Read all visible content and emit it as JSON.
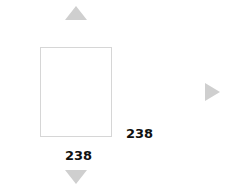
{
  "controls": {
    "up_icon": "triangle-up",
    "down_icon": "triangle-down",
    "right_icon": "triangle-right"
  },
  "box": {
    "width_label": "238",
    "height_label": "238"
  },
  "colors": {
    "arrow": "#cfcfcf",
    "box_border": "#d6d6d6",
    "text": "#111111"
  }
}
